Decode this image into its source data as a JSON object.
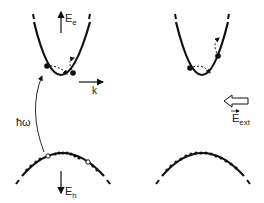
{
  "figure": {
    "left_panel": {
      "conduction_axis_label": "E",
      "conduction_axis_sub": "e",
      "k_axis_label": "k",
      "photon_label": "ħω",
      "valence_axis_label": "E",
      "valence_axis_sub": "h"
    },
    "right_panel": {
      "field_label": "E",
      "field_sub": "ext",
      "field_vector_mark": "→"
    }
  },
  "colors": {
    "ink": "#111111",
    "background": "#ffffff"
  }
}
